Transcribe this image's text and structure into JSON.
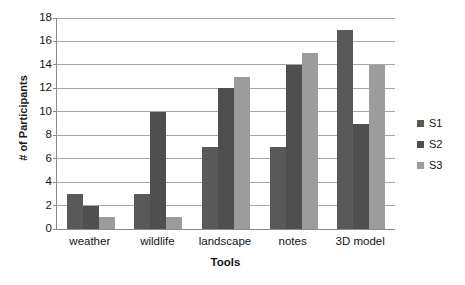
{
  "chart_data": {
    "type": "bar",
    "title": "",
    "xlabel": "Tools",
    "ylabel": "# of Participants",
    "categories": [
      "weather",
      "wildlife",
      "landscape",
      "notes",
      "3D model"
    ],
    "series": [
      {
        "name": "S1",
        "values": [
          3,
          3,
          7,
          7,
          17
        ],
        "color": "#595959"
      },
      {
        "name": "S2",
        "values": [
          2,
          10,
          12,
          14,
          9
        ],
        "color": "#4f4f4f"
      },
      {
        "name": "S3",
        "values": [
          1,
          1,
          13,
          15,
          14
        ],
        "color": "#9c9c9c"
      }
    ],
    "ylim": [
      0,
      18
    ],
    "yticks": [
      0,
      2,
      4,
      6,
      8,
      10,
      12,
      14,
      16,
      18
    ],
    "ytick_labels": [
      "0",
      "2",
      "4",
      "6",
      "8",
      "10",
      "12",
      "14",
      "16",
      "18"
    ],
    "grid": true,
    "legend_position": "right",
    "background": "#ffffff"
  }
}
